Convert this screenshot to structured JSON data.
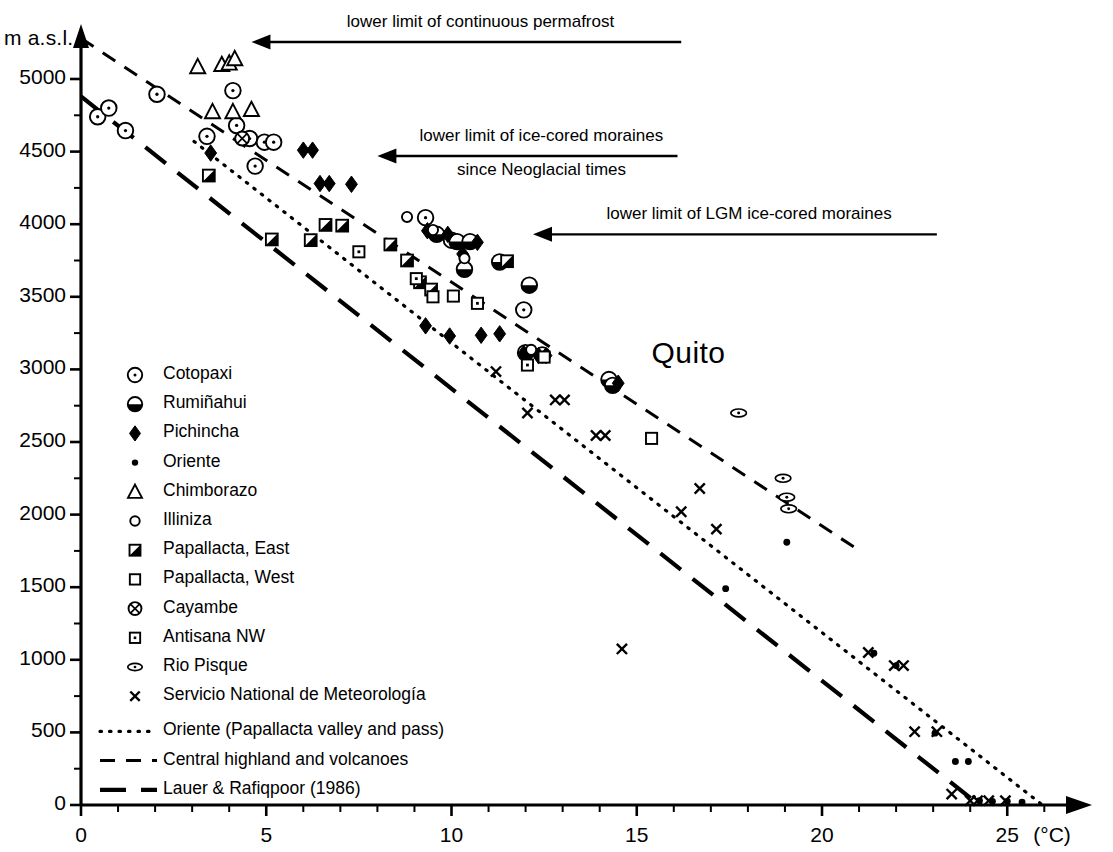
{
  "chart_data": {
    "type": "scatter",
    "title": "",
    "xlabel": "(°C)",
    "ylabel": "m a.s.l.",
    "xlim": [
      0,
      26.2
    ],
    "ylim": [
      0,
      5280
    ],
    "grid": false,
    "legend_position": "inside-left",
    "x_ticks_major": [
      0,
      5,
      10,
      15,
      20,
      25
    ],
    "x_ticks_major_labels": [
      "0",
      "5",
      "10",
      "15",
      "20",
      "25"
    ],
    "x_tick_minor_step": 1,
    "y_ticks_major": [
      0,
      500,
      1000,
      1500,
      2000,
      2500,
      3000,
      3500,
      4000,
      4500,
      5000
    ],
    "y_ticks_major_labels": [
      "0",
      "500",
      "1000",
      "1500",
      "2000",
      "2500",
      "3000",
      "3500",
      "4000",
      "4500",
      "5000"
    ],
    "y_tick_minor_step": 250,
    "annotations": [
      {
        "id": "permafrost",
        "text_lines": [
          "lower limit of continuous permafrost"
        ],
        "arrow_from_x": 16.2,
        "arrow_to_x": 4.6,
        "arrow_y": 5255
      },
      {
        "id": "neoglacial",
        "text_lines": [
          "lower limit of ice-cored moraines",
          "since Neoglacial times"
        ],
        "arrow_from_x": 16.1,
        "arrow_to_x": 8.0,
        "arrow_y": 4470
      },
      {
        "id": "lgm",
        "text_lines": [
          "lower limit of LGM ice-cored moraines"
        ],
        "arrow_from_x": 23.1,
        "arrow_to_x": 12.2,
        "arrow_y": 3930
      }
    ],
    "place_labels": [
      {
        "text": "Quito",
        "x": 15.4,
        "y": 3080
      }
    ],
    "trend_lines": [
      {
        "name": "Oriente (Papallacta valley and pass)",
        "style": "dotted",
        "x0": 3.05,
        "y0": 4570,
        "x1": 25.95,
        "y1": 0
      },
      {
        "name": "Central highland and volcanoes",
        "style": "dashed",
        "x0": 0.0,
        "y0": 5280,
        "x1": 21.05,
        "y1": 1745
      },
      {
        "name": "Lauer & Rafiqpoor (1986)",
        "style": "longdash",
        "x0": 0.0,
        "y0": 4880,
        "x1": 24.25,
        "y1": 0
      }
    ],
    "series": [
      {
        "name": "Cotopaxi",
        "marker": "circle-dot",
        "points": [
          [
            0.45,
            4740
          ],
          [
            0.75,
            4800
          ],
          [
            1.2,
            4645
          ],
          [
            2.05,
            4895
          ],
          [
            3.4,
            4605
          ],
          [
            4.1,
            4920
          ],
          [
            4.2,
            4680
          ],
          [
            4.55,
            4590
          ],
          [
            4.95,
            4565
          ],
          [
            4.7,
            4400
          ],
          [
            5.2,
            4565
          ],
          [
            9.3,
            4045
          ],
          [
            10.0,
            3890
          ],
          [
            11.95,
            3410
          ]
        ]
      },
      {
        "name": "Rumiñahui",
        "marker": "half-circle",
        "points": [
          [
            9.6,
            3930
          ],
          [
            10.15,
            3880
          ],
          [
            10.5,
            3880
          ],
          [
            10.35,
            3690
          ],
          [
            11.3,
            3740
          ],
          [
            12.1,
            3580
          ],
          [
            12.0,
            3115
          ],
          [
            12.45,
            3100
          ],
          [
            14.25,
            2930
          ],
          [
            14.35,
            2890
          ]
        ]
      },
      {
        "name": "Pichincha",
        "marker": "diamond",
        "points": [
          [
            3.5,
            4490
          ],
          [
            6.0,
            4510
          ],
          [
            6.25,
            4510
          ],
          [
            6.45,
            4280
          ],
          [
            6.7,
            4280
          ],
          [
            7.3,
            4275
          ],
          [
            9.35,
            3955
          ],
          [
            9.9,
            3930
          ],
          [
            10.7,
            3875
          ],
          [
            10.3,
            3795
          ],
          [
            9.3,
            3300
          ],
          [
            9.95,
            3230
          ],
          [
            10.8,
            3235
          ],
          [
            11.3,
            3245
          ],
          [
            11.95,
            3110
          ],
          [
            12.35,
            3095
          ],
          [
            12.55,
            3095
          ],
          [
            14.5,
            2905
          ]
        ]
      },
      {
        "name": "Oriente",
        "marker": "dot",
        "points": [
          [
            17.4,
            1490
          ],
          [
            19.05,
            1810
          ],
          [
            21.4,
            1045
          ],
          [
            22.0,
            960
          ],
          [
            23.05,
            495
          ],
          [
            23.6,
            300
          ],
          [
            23.95,
            300
          ],
          [
            24.25,
            30
          ],
          [
            24.6,
            25
          ],
          [
            25.0,
            25
          ],
          [
            25.4,
            20
          ]
        ]
      },
      {
        "name": "Chimborazo",
        "marker": "triangle",
        "points": [
          [
            3.15,
            5085
          ],
          [
            3.8,
            5100
          ],
          [
            4.0,
            5110
          ],
          [
            4.15,
            5140
          ],
          [
            3.55,
            4775
          ],
          [
            4.1,
            4775
          ],
          [
            4.6,
            4790
          ]
        ]
      },
      {
        "name": "Illiniza",
        "marker": "circle-open",
        "points": [
          [
            8.8,
            4050
          ],
          [
            9.5,
            3960
          ],
          [
            10.35,
            3765
          ],
          [
            12.15,
            3135
          ]
        ]
      },
      {
        "name": "Papallacta, East",
        "marker": "square-half",
        "points": [
          [
            3.45,
            4335
          ],
          [
            5.15,
            3895
          ],
          [
            6.2,
            3890
          ],
          [
            6.6,
            3995
          ],
          [
            7.05,
            3990
          ],
          [
            8.35,
            3860
          ],
          [
            8.8,
            3750
          ],
          [
            9.15,
            3600
          ],
          [
            11.5,
            3745
          ],
          [
            9.45,
            3550
          ]
        ]
      },
      {
        "name": "Papallacta, West",
        "marker": "square-open",
        "points": [
          [
            9.5,
            3500
          ],
          [
            10.05,
            3505
          ],
          [
            12.5,
            3085
          ],
          [
            15.4,
            2525
          ]
        ]
      },
      {
        "name": "Cayambe",
        "marker": "circle-cross",
        "points": [
          [
            4.35,
            4590
          ]
        ]
      },
      {
        "name": "Antisana NW",
        "marker": "square-dot",
        "points": [
          [
            7.5,
            3810
          ],
          [
            9.05,
            3625
          ],
          [
            10.7,
            3455
          ],
          [
            12.05,
            3030
          ]
        ]
      },
      {
        "name": "Rio Pisque",
        "marker": "ellipse-dot",
        "points": [
          [
            17.75,
            2700
          ],
          [
            18.95,
            2250
          ],
          [
            19.05,
            2120
          ],
          [
            19.1,
            2040
          ]
        ]
      },
      {
        "name": "Servicio National de Meteorología",
        "marker": "x",
        "points": [
          [
            11.2,
            2985
          ],
          [
            12.05,
            2700
          ],
          [
            12.8,
            2790
          ],
          [
            13.05,
            2790
          ],
          [
            13.9,
            2545
          ],
          [
            14.15,
            2545
          ],
          [
            16.2,
            2020
          ],
          [
            16.7,
            2180
          ],
          [
            17.15,
            1900
          ],
          [
            14.6,
            1075
          ],
          [
            21.25,
            1050
          ],
          [
            21.95,
            960
          ],
          [
            22.2,
            960
          ],
          [
            22.5,
            505
          ],
          [
            23.1,
            505
          ],
          [
            23.5,
            75
          ],
          [
            24.0,
            30
          ],
          [
            24.2,
            30
          ],
          [
            24.5,
            30
          ],
          [
            24.95,
            30
          ]
        ]
      }
    ]
  },
  "legend": {
    "markers": [
      {
        "label": "Cotopaxi",
        "marker": "circle-dot"
      },
      {
        "label": "Rumiñahui",
        "marker": "half-circle"
      },
      {
        "label": "Pichincha",
        "marker": "diamond"
      },
      {
        "label": "Oriente",
        "marker": "dot"
      },
      {
        "label": "Chimborazo",
        "marker": "triangle"
      },
      {
        "label": "Illiniza",
        "marker": "circle-open"
      },
      {
        "label": "Papallacta, East",
        "marker": "square-half"
      },
      {
        "label": "Papallacta, West",
        "marker": "square-open"
      },
      {
        "label": "Cayambe",
        "marker": "circle-cross"
      },
      {
        "label": "Antisana NW",
        "marker": "square-dot"
      },
      {
        "label": "Rio Pisque",
        "marker": "ellipse-dot"
      },
      {
        "label": "Servicio National de Meteorología",
        "marker": "x"
      }
    ],
    "lines": [
      {
        "label": "Oriente (Papallacta valley and pass)",
        "style": "dotted"
      },
      {
        "label": "Central highland and volcanoes",
        "style": "dashed"
      },
      {
        "label": "Lauer & Rafiqpoor (1986)",
        "style": "longdash"
      }
    ]
  }
}
